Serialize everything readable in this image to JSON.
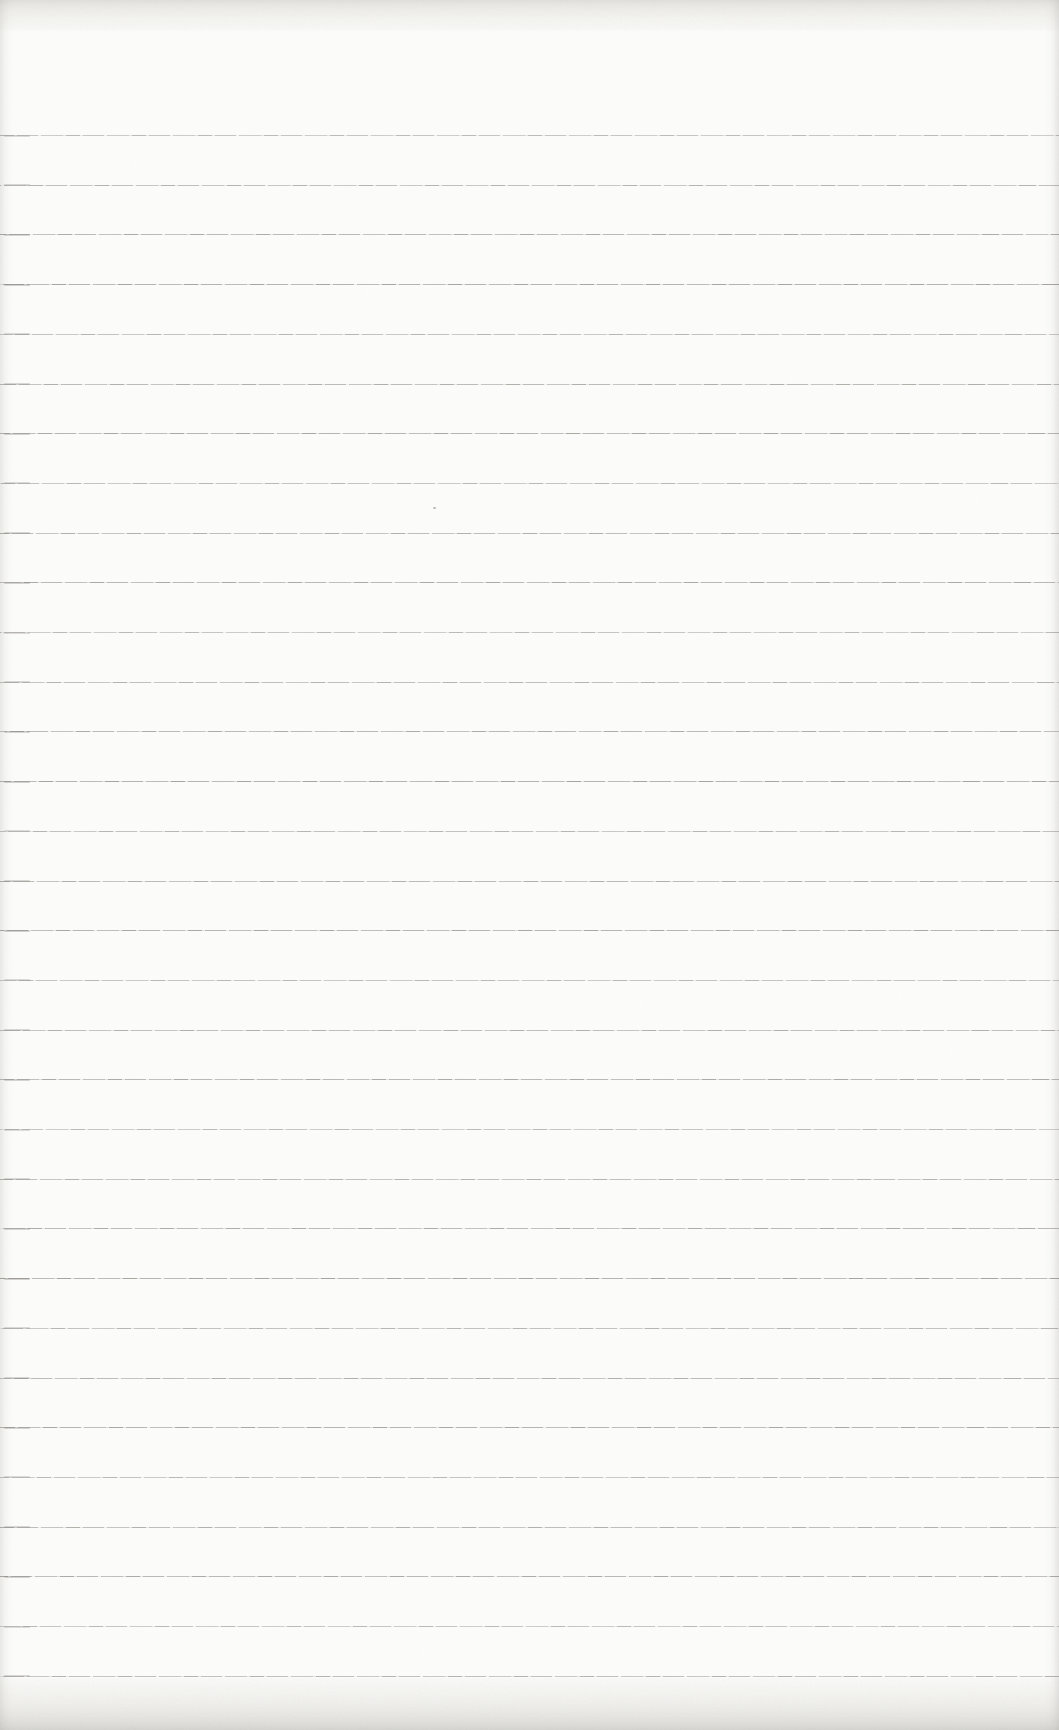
{
  "page": {
    "paper_color": "#fcfcfa",
    "content_text": ""
  },
  "ruling": {
    "line_count": 32,
    "first_line_y_px": 135,
    "line_spacing_px": 49.7,
    "line_color": "#68665f",
    "line_style": "thin faint broken grainy horizontal rules, full page width"
  },
  "marks": {
    "speck": {
      "x_px": 433,
      "y_px": 507,
      "color": "#b9b7b0"
    }
  }
}
